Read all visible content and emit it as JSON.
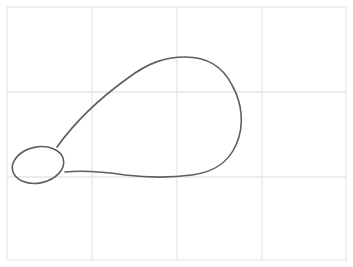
{
  "canvas": {
    "width": 353,
    "height": 267,
    "background": "#ffffff",
    "frame": {
      "x": 7,
      "y": 7,
      "width": 339,
      "height": 253,
      "color": "#ececec"
    },
    "grid": {
      "color": "#e6e6e6",
      "vertical_lines_x": [
        92,
        177,
        262
      ],
      "horizontal_lines_y": [
        92,
        177
      ]
    },
    "sketch": {
      "stroke_color": "#5e5e5e",
      "stroke_width": 1.6,
      "shapes": [
        {
          "name": "small-ellipse",
          "type": "ellipse",
          "cx": 38,
          "cy": 165,
          "rx": 26,
          "ry": 18,
          "rotate": -12
        },
        {
          "name": "large-teardrop",
          "type": "path",
          "d": "M57,147 C75,122 100,98 128,78 C148,63 165,57 185,57 C205,57 222,65 232,85 C242,103 245,125 236,145 C228,163 214,172 192,175 C170,178 150,178 125,175 C105,172 85,170 65,172"
        }
      ]
    }
  }
}
